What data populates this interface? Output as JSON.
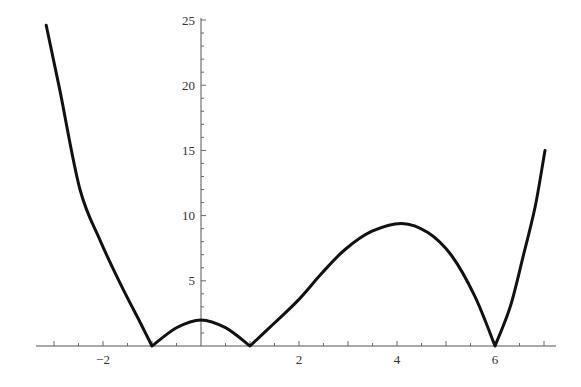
{
  "chart_data": {
    "type": "line",
    "title": "",
    "xlabel": "",
    "ylabel": "",
    "xlim": [
      -3.35,
      7.2
    ],
    "ylim": [
      0,
      25
    ],
    "grid": false,
    "legend": null,
    "x_ticks_major": [
      -2,
      2,
      4,
      6
    ],
    "x_tick_labels": [
      "−2",
      "2",
      "4",
      "6"
    ],
    "x_ticks_minor_step": 0.5,
    "y_ticks_major": [
      5,
      10,
      15,
      20,
      25
    ],
    "y_tick_labels": [
      "5",
      "10",
      "15",
      "20",
      "25"
    ],
    "y_ticks_minor_step": 1,
    "series": [
      {
        "name": "f(x)",
        "color": "#111111",
        "x": [
          -3.16,
          -2.88,
          -2.47,
          -2.06,
          -1.65,
          -1.24,
          -1.0,
          -0.5,
          0.0,
          0.5,
          1.0,
          1.51,
          1.98,
          2.47,
          2.94,
          3.49,
          4.1,
          4.63,
          5.12,
          5.59,
          6.0,
          6.31,
          6.57,
          6.82,
          7.02
        ],
        "y": [
          24.6,
          19.6,
          12.0,
          8.1,
          4.8,
          1.8,
          0.0,
          1.4,
          2.0,
          1.4,
          0.0,
          1.8,
          3.5,
          5.6,
          7.4,
          8.8,
          9.4,
          8.7,
          6.9,
          3.8,
          0.0,
          3.0,
          6.8,
          10.7,
          15.0
        ]
      }
    ],
    "annotations": [
      {
        "text": "cusp minimum",
        "x": -1,
        "y": 0
      },
      {
        "text": "cusp minimum",
        "x": 1,
        "y": 0
      },
      {
        "text": "cusp minimum",
        "x": 6,
        "y": 0
      },
      {
        "text": "local maximum",
        "x": 4.1,
        "y": 9.4
      }
    ]
  },
  "layout": {
    "origin_px": [
      201,
      346
    ],
    "px_per_x": 49,
    "px_per_y": 13.04,
    "x_axis_px": [
      36,
      556
    ],
    "y_axis_px": [
      18,
      346
    ]
  }
}
